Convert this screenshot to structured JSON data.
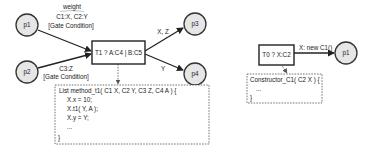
{
  "diagram": {
    "left": {
      "places": {
        "p1": "p1",
        "p2": "p2",
        "p3": "p3",
        "p4": "p4"
      },
      "transition": "T1 ? A:C4 | B:C5",
      "arc_p1": {
        "weight_label": "weight",
        "weight_value": "C1:X, C2:Y",
        "gate": "[Gate Condition]"
      },
      "arc_p2": {
        "weight_value": "C3:Z",
        "gate": "[Gate Condition]"
      },
      "arc_p3_label": "X, Z",
      "arc_p4_label": "Y",
      "method_box": {
        "lines": [
          "List method_t1( C1 X, C2 Y, C3 Z, C4 A ) {",
          "X.x = 10;",
          "X.t1( Y, A );",
          "X.y = Y;",
          "...",
          "}"
        ]
      }
    },
    "right": {
      "transition": "T0 ? X:C2",
      "place": "p1",
      "arc_label": "X: new C1()",
      "constructor_box": {
        "lines": [
          "Constructor_C1( C2 X ) {",
          "...",
          "}"
        ]
      }
    }
  }
}
